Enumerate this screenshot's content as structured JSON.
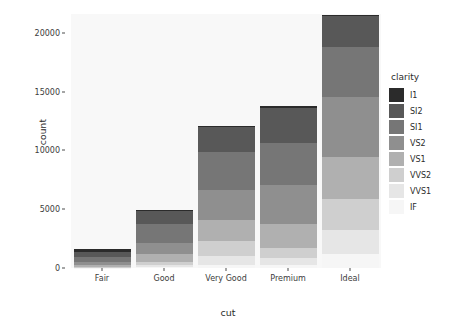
{
  "chart_data": {
    "type": "bar",
    "stacked": true,
    "title": "",
    "xlabel": "cut",
    "ylabel": "count",
    "categories": [
      "Fair",
      "Good",
      "Very Good",
      "Premium",
      "Ideal"
    ],
    "ylim": [
      0,
      21600
    ],
    "yticks": [
      0,
      5000,
      10000,
      15000,
      20000
    ],
    "ytick_labels": [
      "0",
      "5000",
      "10000",
      "15000",
      "20000"
    ],
    "grid": false,
    "legend_title": "clarity",
    "legend_position": "right",
    "panel_background": "#f8f8f8",
    "series": [
      {
        "name": "I1",
        "color": "#2b2b2b",
        "values": [
          210,
          96,
          84,
          205,
          146
        ]
      },
      {
        "name": "SI2",
        "color": "#585858",
        "values": [
          466,
          1081,
          2100,
          2949,
          2598
        ]
      },
      {
        "name": "SI1",
        "color": "#767676",
        "values": [
          408,
          1560,
          3240,
          3575,
          4282
        ]
      },
      {
        "name": "VS2",
        "color": "#8f8f8f",
        "values": [
          261,
          978,
          2591,
          3357,
          5071
        ]
      },
      {
        "name": "VS1",
        "color": "#b0b0b0",
        "values": [
          170,
          648,
          1775,
          1989,
          3589
        ]
      },
      {
        "name": "VVS2",
        "color": "#cfcfcf",
        "values": [
          69,
          286,
          1235,
          870,
          2606
        ]
      },
      {
        "name": "VVS1",
        "color": "#e6e6e6",
        "values": [
          17,
          186,
          789,
          616,
          2047
        ]
      },
      {
        "name": "IF",
        "color": "#f6f6f6",
        "values": [
          9,
          71,
          268,
          230,
          1212
        ]
      }
    ],
    "totals": [
      1610,
      4906,
      12082,
      13791,
      21551
    ]
  }
}
